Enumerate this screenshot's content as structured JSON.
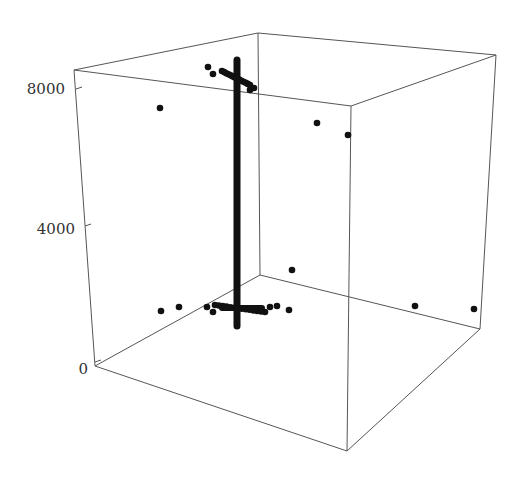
{
  "chart_data": {
    "type": "scatter",
    "dimensions": 3,
    "title": "",
    "xlabel": "",
    "ylabel": "",
    "zlabel": "",
    "z_ticks": [
      {
        "label": "0",
        "value": 0
      },
      {
        "label": "4000",
        "value": 4000
      },
      {
        "label": "8000",
        "value": 8000
      }
    ],
    "zlim": [
      0,
      8500
    ],
    "grid": false,
    "legend": null,
    "box": true,
    "marker_color": "#111111",
    "edge_color": "#555555",
    "projected_points": [
      {
        "x": 160,
        "y": 108,
        "z_approx": 7400
      },
      {
        "x": 317,
        "y": 123,
        "z_approx": 6900
      },
      {
        "x": 348,
        "y": 135,
        "z_approx": 6600
      },
      {
        "x": 292,
        "y": 270,
        "z_approx": 2900
      },
      {
        "x": 415,
        "y": 306,
        "z_approx": 1800
      },
      {
        "x": 474,
        "y": 309,
        "z_approx": 1800
      },
      {
        "x": 161,
        "y": 311,
        "z_approx": 1700
      },
      {
        "x": 179,
        "y": 307,
        "z_approx": 1800
      },
      {
        "x": 207,
        "y": 307,
        "z_approx": 1800
      },
      {
        "x": 213,
        "y": 312,
        "z_approx": 1700
      },
      {
        "x": 270,
        "y": 307,
        "z_approx": 1800
      },
      {
        "x": 277,
        "y": 306,
        "z_approx": 1800
      },
      {
        "x": 289,
        "y": 310,
        "z_approx": 1700
      },
      {
        "x": 208,
        "y": 67,
        "z_approx": 8300
      },
      {
        "x": 213,
        "y": 74,
        "z_approx": 8200
      },
      {
        "x": 250,
        "y": 90,
        "z_approx": 7900
      },
      {
        "x": 254,
        "y": 88,
        "z_approx": 7900
      }
    ],
    "clusters": [
      {
        "name": "upper-cluster",
        "x_from": 222,
        "x_to": 250,
        "y_from": 71,
        "y_to": 85,
        "z_approx": 8100
      },
      {
        "name": "lower-cluster",
        "x_from": 215,
        "x_to": 265,
        "y_from": 305,
        "y_to": 312,
        "z_approx": 1750
      }
    ],
    "vertical_bar": {
      "x": 237,
      "y_top": 60,
      "y_bottom": 326,
      "z_from": 1300,
      "z_to": 8600
    },
    "horizontal_cross": {
      "x_from": 222,
      "x_to": 262,
      "y": 308
    }
  }
}
